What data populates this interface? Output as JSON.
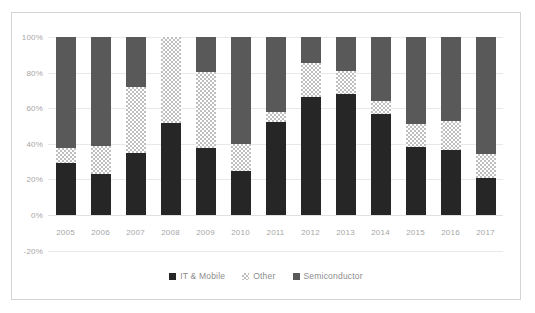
{
  "chart_data": {
    "type": "bar",
    "subtype": "stacked-100-percent",
    "title": "",
    "xlabel": "",
    "ylabel": "",
    "ylim": [
      -20,
      100
    ],
    "ytick_values": [
      100,
      80,
      60,
      40,
      20,
      0,
      -20
    ],
    "ytick_labels": [
      "100%",
      "80%",
      "60%",
      "40%",
      "20%",
      "0%",
      "-20%"
    ],
    "grid": true,
    "legend_position": "bottom",
    "categories": [
      "2005",
      "2006",
      "2007",
      "2008",
      "2009",
      "2010",
      "2011",
      "2012",
      "2013",
      "2014",
      "2015",
      "2016",
      "2017"
    ],
    "series": [
      {
        "name": "IT & Mobile",
        "color": "#262626",
        "pattern": "solid",
        "values": [
          29,
          23,
          35,
          51.5,
          37.5,
          25,
          52.5,
          66.5,
          68,
          57,
          38,
          36.5,
          21
        ]
      },
      {
        "name": "Other",
        "color": "#bfbfbf",
        "pattern": "checkered-hatch",
        "values": [
          8.5,
          16,
          37,
          48.5,
          43,
          15,
          5.5,
          19,
          13,
          7,
          13,
          16.5,
          13.5
        ]
      },
      {
        "name": "Semiconductor",
        "color": "#595959",
        "pattern": "solid",
        "values": [
          62.5,
          61,
          28,
          0,
          19.5,
          60,
          42,
          14.5,
          19,
          36,
          49,
          47,
          65.5
        ]
      }
    ],
    "cumulative_tops": {
      "it_mobile": [
        29,
        23,
        35,
        51.5,
        37.5,
        25,
        52.5,
        66.5,
        68,
        57,
        38,
        36.5,
        21
      ],
      "other": [
        37.5,
        39,
        72,
        100,
        80.5,
        40,
        58,
        85.5,
        81,
        64,
        51,
        53,
        34.5
      ],
      "total": [
        100,
        100,
        100,
        100,
        100,
        100,
        100,
        100,
        100,
        100,
        100,
        100,
        100
      ]
    }
  },
  "legend": {
    "items": [
      {
        "label": "IT & Mobile",
        "swatch": "legend-swatch-it-mobile"
      },
      {
        "label": "Other",
        "swatch": "legend-swatch-other"
      },
      {
        "label": "Semiconductor",
        "swatch": "legend-swatch-semiconductor"
      }
    ]
  },
  "colors": {
    "it_mobile": "#262626",
    "other": "#bfbfbf",
    "semiconductor": "#595959",
    "gridline": "#e8e8e8",
    "tick_text": "#a6a6a6",
    "legend_text": "#8c8c8c",
    "frame_border": "#d4d4d4",
    "background": "#ffffff"
  }
}
